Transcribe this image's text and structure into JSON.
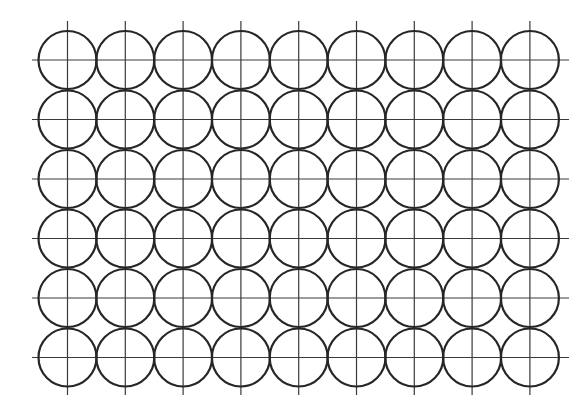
{
  "diagram": {
    "rows": 6,
    "columns": 9,
    "origin_x": 67.5,
    "origin_y": 60,
    "col_spacing": 57.8,
    "row_spacing": 59.5,
    "circle_radius": 29,
    "vline_top": 21,
    "vline_bottom": 395,
    "hline_left": 32,
    "hline_right": 569,
    "colors": {
      "background": "#ffffff",
      "circle_stroke": "#262626",
      "line_stroke": "#3a3a3a"
    },
    "circle_stroke_width": 2.2,
    "line_stroke_width": 1.2
  }
}
